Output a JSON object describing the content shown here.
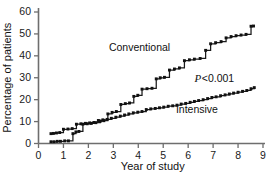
{
  "chart_data": {
    "type": "line",
    "title": "",
    "subtitle": "",
    "xlabel": "Year of study",
    "ylabel": "Percentage of patients",
    "xlim": [
      0,
      9
    ],
    "ylim": [
      0,
      60
    ],
    "xticks": [
      0,
      1,
      2,
      3,
      4,
      5,
      6,
      7,
      8,
      9
    ],
    "yticks": [
      0,
      10,
      20,
      30,
      40,
      50,
      60
    ],
    "xtick_labels": [
      "0",
      "1",
      "2",
      "3",
      "4",
      "5",
      "6",
      "7",
      "8",
      "9"
    ],
    "ytick_labels": [
      "0",
      "10",
      "20",
      "30",
      "40",
      "50",
      "60"
    ],
    "grid": false,
    "legend_position": "inline-annotation",
    "step_style": "post",
    "marker_style": "square",
    "annotations": [
      {
        "name": "conventional-label",
        "text": "Conventional",
        "x": 4.05,
        "y": 43.5
      },
      {
        "name": "intensive-label",
        "text": "Intensive",
        "x": 6.35,
        "y": 15.0
      },
      {
        "name": "pvalue-label",
        "text_italic": "P",
        "text_rest": "<0.001",
        "x": 7.05,
        "y": 29.5
      }
    ],
    "series": [
      {
        "name": "Conventional",
        "color": "#111111",
        "x": [
          0.5,
          0.62,
          0.75,
          0.88,
          1.05,
          1.2,
          1.38,
          1.5,
          1.62,
          1.78,
          1.95,
          2.12,
          2.3,
          2.48,
          2.62,
          2.78,
          2.95,
          3.12,
          3.3,
          3.48,
          3.65,
          3.82,
          3.98,
          4.15,
          4.35,
          4.55,
          4.72,
          4.88,
          5.05,
          5.25,
          5.45,
          5.65,
          5.85,
          6.05,
          6.25,
          6.48,
          6.7,
          6.9,
          7.1,
          7.32,
          7.52,
          7.72,
          7.92,
          8.12,
          8.32,
          8.52,
          8.62
        ],
        "y": [
          0.8,
          0.8,
          1.0,
          1.0,
          1.2,
          1.2,
          4.5,
          5.3,
          5.5,
          8.8,
          9.0,
          9.2,
          9.5,
          10.2,
          10.4,
          13.5,
          14.2,
          14.6,
          17.8,
          18.2,
          18.5,
          21.5,
          22.0,
          24.8,
          25.0,
          25.2,
          29.5,
          30.0,
          30.2,
          33.5,
          34.0,
          34.5,
          37.8,
          38.2,
          38.5,
          38.8,
          42.5,
          45.5,
          46.0,
          46.5,
          48.2,
          48.8,
          49.2,
          49.5,
          49.8,
          53.5,
          53.6
        ]
      },
      {
        "name": "Intensive",
        "color": "#111111",
        "x": [
          0.5,
          0.6,
          0.72,
          0.85,
          1.0,
          1.18,
          1.35,
          1.52,
          1.7,
          1.88,
          2.05,
          2.22,
          2.4,
          2.58,
          2.75,
          2.92,
          3.1,
          3.28,
          3.45,
          3.62,
          3.8,
          3.98,
          4.15,
          4.32,
          4.5,
          4.68,
          4.85,
          5.02,
          5.2,
          5.38,
          5.55,
          5.72,
          5.9,
          6.08,
          6.25,
          6.42,
          6.6,
          6.78,
          6.95,
          7.12,
          7.3,
          7.48,
          7.65,
          7.82,
          8.0,
          8.18,
          8.35,
          8.52,
          8.65
        ],
        "y": [
          4.5,
          4.6,
          4.8,
          5.0,
          6.5,
          6.6,
          6.8,
          8.8,
          9.0,
          9.2,
          9.4,
          9.6,
          10.5,
          10.8,
          11.0,
          11.5,
          12.0,
          12.5,
          13.0,
          13.5,
          14.0,
          14.3,
          14.6,
          15.5,
          15.8,
          16.0,
          16.3,
          16.6,
          17.0,
          17.2,
          17.5,
          18.0,
          18.3,
          18.8,
          19.2,
          19.6,
          20.0,
          20.5,
          21.0,
          21.3,
          21.8,
          22.2,
          22.6,
          23.0,
          23.4,
          23.8,
          24.2,
          25.0,
          25.5
        ]
      }
    ]
  }
}
